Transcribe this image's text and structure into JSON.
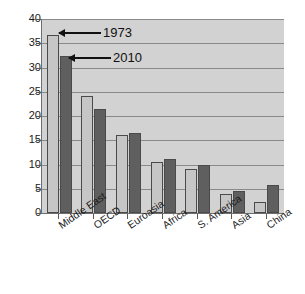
{
  "chart_data": {
    "type": "bar",
    "title": "",
    "xlabel": "",
    "ylabel": "",
    "ylim": [
      0,
      40
    ],
    "yticks": [
      0,
      5,
      10,
      15,
      20,
      25,
      30,
      35,
      40
    ],
    "grid": true,
    "legend_position": "none",
    "categories": [
      "Middle East",
      "OECD",
      "Euroasia",
      "Africa",
      "S. America",
      "Asia",
      "China"
    ],
    "series": [
      {
        "name": "1973",
        "color": "#c6c6c6",
        "values": [
          36.8,
          24.2,
          16.0,
          10.6,
          9.0,
          4.0,
          2.3
        ]
      },
      {
        "name": "2010",
        "color": "#5f5f5f",
        "values": [
          32.3,
          21.5,
          16.5,
          11.2,
          10.0,
          4.5,
          5.7
        ]
      }
    ],
    "annotations": [
      {
        "text": "1973",
        "points_to_series": "1973",
        "points_to_category": "Middle East"
      },
      {
        "text": "2010",
        "points_to_series": "2010",
        "points_to_category": "Middle East"
      }
    ]
  },
  "colors": {
    "plot_background": "#d2d2d2",
    "gridline": "#8a8a8a",
    "axis": "#6e6e6e",
    "text": "#1a1a1a",
    "series_1973": "#c6c6c6",
    "series_2010": "#5f5f5f"
  }
}
